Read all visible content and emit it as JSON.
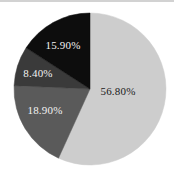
{
  "chart_data": {
    "type": "pie",
    "title": "",
    "subtitle": "",
    "xlabel": "",
    "ylabel": "",
    "legend": "none",
    "grid": false,
    "start_angle_deg": 0,
    "direction": "clockwise",
    "categories": [
      "Segment 1",
      "Segment 2",
      "Segment 3",
      "Segment 4"
    ],
    "values": [
      56.8,
      18.9,
      8.4,
      15.9
    ],
    "labels": [
      "56.80%",
      "18.90%",
      "8.40%",
      "15.90%"
    ],
    "colors": [
      "#cdcdcd",
      "#5a5a5a",
      "#3a3a3a",
      "#0d0d0d"
    ],
    "label_colors": [
      "dark",
      "light",
      "light",
      "light"
    ],
    "total": 100.0,
    "slices": [
      {
        "label": "56.80%",
        "value": 56.8,
        "color": "#cdcdcd",
        "label_x": 118,
        "label_y": 91,
        "label_tone": "dark"
      },
      {
        "label": "18.90%",
        "value": 18.9,
        "color": "#5a5a5a",
        "label_x": 45,
        "label_y": 110,
        "label_tone": "light"
      },
      {
        "label": "8.40%",
        "value": 8.4,
        "color": "#3a3a3a",
        "label_x": 38,
        "label_y": 73,
        "label_tone": "light"
      },
      {
        "label": "15.90%",
        "value": 15.9,
        "color": "#0d0d0d",
        "label_x": 63,
        "label_y": 45,
        "label_tone": "light"
      }
    ],
    "geometry": {
      "cx": 90,
      "cy": 89,
      "r": 76
    },
    "background_color": "#ffffff",
    "rule_color": "#d2d2d2"
  }
}
